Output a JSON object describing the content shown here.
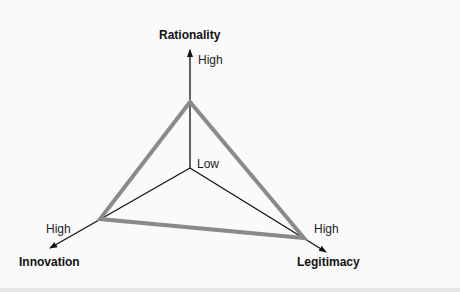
{
  "diagram": {
    "axes": [
      {
        "name": "Rationality",
        "high_label": "High"
      },
      {
        "name": "Innovation",
        "high_label": "High"
      },
      {
        "name": "Legitimacy",
        "high_label": "High"
      }
    ],
    "origin_label": "Low",
    "colors": {
      "triangle": "#8a8a8a",
      "axis": "#111111",
      "background": "#fafafa"
    }
  }
}
